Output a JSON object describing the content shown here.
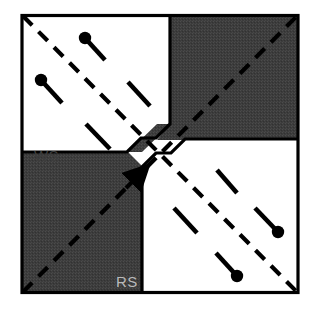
{
  "figure": {
    "type": "schematic-diagram",
    "title": "",
    "canvas": {
      "width": 316,
      "height": 316
    },
    "frame": {
      "x": 21,
      "y": 14,
      "width": 278,
      "height": 280,
      "stroke_color": "#000000",
      "stroke_width": 3.2
    },
    "colors": {
      "background": "#ffffff",
      "dark_region_fill": "#3c3c3c",
      "dark_region_texture": "#4a4a4a",
      "line_color": "#000000",
      "label_on_white": "#3d3d3d",
      "label_on_dark": "#b9b9b9"
    },
    "labels": [
      {
        "name": "ws-label",
        "text": "WS",
        "x": 34,
        "y": 161,
        "on": "white-region",
        "quadrant": "top-left"
      },
      {
        "name": "rs-label",
        "text": "RS",
        "x": 116,
        "y": 287,
        "on": "dark-region",
        "quadrant": "bottom-left"
      }
    ],
    "regions": [
      {
        "name": "top-left-white-region",
        "kind": "white",
        "label": "WS",
        "polygon": "22,15 170,15 170,124 156,138 140,138 127,151 22,151"
      },
      {
        "name": "top-right-dark-region",
        "kind": "dark",
        "label": "",
        "polygon": "170,15 298,15 298,140 157,140 170,124"
      },
      {
        "name": "bottom-left-dark-region",
        "kind": "dark",
        "label": "RS",
        "polygon": "22,152 128,152 142,166 142,293 22,293"
      },
      {
        "name": "bottom-right-white-region",
        "kind": "white",
        "label": "",
        "polygon": "143,167 156,153 171,153 184,140 298,140 298,293 143,293"
      }
    ],
    "main_diagonals": [
      {
        "name": "primary-dashed-diagonal",
        "description": "dashed line from top-left corner to bottom-right corner",
        "x1": 23,
        "y1": 16,
        "x2": 297,
        "y2": 292,
        "style": "dashed",
        "dash_pattern": "13 9",
        "stroke_width": 4.2
      },
      {
        "name": "secondary-dashed-diagonal",
        "description": "dashed line from bottom-left corner to top-right corner",
        "x1": 23,
        "y1": 292,
        "x2": 297,
        "y2": 16,
        "style": "dashed",
        "dash_pattern": "13 9",
        "stroke_width": 4.2,
        "arrow_at_midpoint": true
      }
    ],
    "ticks": [
      {
        "name": "tick-segment-1",
        "quadrant": "top-left",
        "x1": 85,
        "y1": 38,
        "x2": 105,
        "y2": 60,
        "dot_end": "start",
        "dot_radius": 6.2
      },
      {
        "name": "tick-segment-2",
        "quadrant": "top-left",
        "x1": 41,
        "y1": 80,
        "x2": 62,
        "y2": 103,
        "dot_end": "start",
        "dot_radius": 6.2
      },
      {
        "name": "tick-segment-3",
        "quadrant": "top-left",
        "x1": 128,
        "y1": 82,
        "x2": 150,
        "y2": 106,
        "dot_end": "none",
        "dot_radius": 0
      },
      {
        "name": "tick-segment-4",
        "quadrant": "top-left",
        "x1": 86,
        "y1": 124,
        "x2": 110,
        "y2": 149,
        "dot_end": "none",
        "dot_radius": 0
      },
      {
        "name": "tick-segment-5",
        "quadrant": "bottom-right",
        "x1": 217,
        "y1": 170,
        "x2": 237,
        "y2": 193,
        "dot_end": "none",
        "dot_radius": 0
      },
      {
        "name": "tick-segment-6",
        "quadrant": "bottom-right",
        "x1": 255,
        "y1": 208,
        "x2": 278,
        "y2": 232,
        "dot_end": "end",
        "dot_radius": 6.2
      },
      {
        "name": "tick-segment-7",
        "quadrant": "bottom-right",
        "x1": 174,
        "y1": 208,
        "x2": 197,
        "y2": 233,
        "dot_end": "none",
        "dot_radius": 0
      },
      {
        "name": "tick-segment-8",
        "quadrant": "bottom-right",
        "x1": 216,
        "y1": 253,
        "x2": 237,
        "y2": 276,
        "dot_end": "end",
        "dot_radius": 6.2
      }
    ]
  }
}
